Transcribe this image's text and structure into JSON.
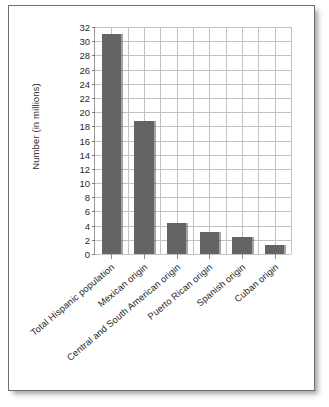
{
  "figure": {
    "background_color": "#ffffff",
    "border_color": "#6e6e6e",
    "bar_color": "#646464",
    "grid_color": "#c2c2c2",
    "axis_color": "#9a9a9a"
  },
  "chart_data": {
    "type": "bar",
    "title": "",
    "subtitle": "",
    "xlabel": "",
    "ylabel": "Number (in millions)",
    "categories": [
      "Total Hispanic population",
      "Mexican origin",
      "Central and South American origin",
      "Puerto Rican origin",
      "Spanish origin",
      "Cuban origin"
    ],
    "values": [
      31.0,
      18.8,
      4.4,
      3.1,
      2.4,
      1.3
    ],
    "ylim": [
      0,
      32
    ],
    "ytick_step": 2,
    "ytick_labels": [
      "0",
      "2",
      "4",
      "6",
      "8",
      "10",
      "12",
      "14",
      "16",
      "18",
      "20",
      "22",
      "24",
      "26",
      "28",
      "30",
      "32"
    ],
    "grid": true,
    "grid_axis": "both",
    "legend": false,
    "legend_position": "none",
    "xtick_rotation": -40,
    "series": [
      {
        "name": "Number (in millions)",
        "values": [
          31.0,
          18.8,
          4.4,
          3.1,
          2.4,
          1.3
        ]
      }
    ]
  }
}
